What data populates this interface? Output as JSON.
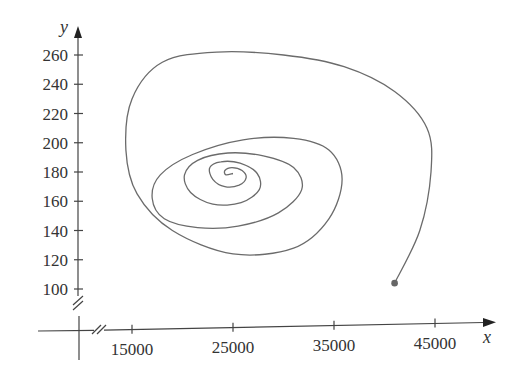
{
  "chart_data": {
    "type": "line",
    "title": "",
    "xlabel": "x",
    "ylabel": "y",
    "xlim": [
      8000,
      50000
    ],
    "ylim": [
      75,
      275
    ],
    "grid": false,
    "legend": null,
    "x_ticks": [
      15000,
      25000,
      35000,
      45000
    ],
    "x_tick_labels": [
      "15000",
      "25000",
      "35000",
      "45000"
    ],
    "y_ticks": [
      100,
      120,
      140,
      160,
      180,
      200,
      220,
      240,
      260
    ],
    "y_tick_labels": [
      "100",
      "120",
      "140",
      "160",
      "180",
      "200",
      "220",
      "240",
      "260"
    ],
    "axis_breaks": [
      "x-axis near origin",
      "y-axis near origin"
    ],
    "annotations": [
      "start point marked with filled dot at approx (41000, 104)"
    ],
    "series": [
      {
        "name": "trajectory",
        "start_point": {
          "x": 41000,
          "y": 104
        },
        "equilibrium_approx": {
          "x": 25000,
          "y": 180
        },
        "x": [
          41000,
          43500,
          44600,
          44200,
          41000,
          36000,
          30000,
          23400,
          18000,
          15000,
          14400,
          15500,
          19000,
          25000,
          31000,
          34500,
          35800,
          34500,
          31000,
          26000,
          21000,
          17800,
          17000,
          18200,
          21500,
          25500,
          29500,
          31800,
          31000,
          28000,
          24500,
          21500,
          20200,
          20800,
          23000,
          25800,
          27600,
          27400,
          25700,
          23800,
          22700,
          23000,
          24200,
          25600,
          26300,
          25900,
          24900,
          24200,
          24300,
          25000
        ],
        "y": [
          104,
          140,
          180,
          210,
          235,
          252,
          260,
          262,
          255,
          230,
          195,
          165,
          140,
          124,
          128,
          148,
          175,
          195,
          203,
          202,
          192,
          178,
          162,
          148,
          142,
          143,
          152,
          168,
          183,
          191,
          193,
          188,
          178,
          166,
          158,
          159,
          168,
          179,
          186,
          187,
          183,
          175,
          170,
          171,
          176,
          181,
          183,
          181,
          178,
          179
        ]
      }
    ]
  }
}
